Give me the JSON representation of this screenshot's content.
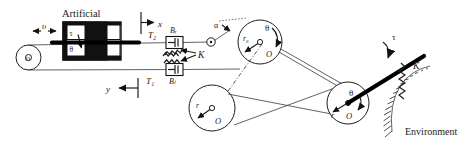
{
  "figure": {
    "title": "Artificial",
    "environment_label": "Environment",
    "background_color": "#ffffff",
    "ink_color": "#111111"
  },
  "labels": {
    "velocity": "υ",
    "artificial": "Artificial",
    "tau_actuator": "τ",
    "theta_actuator": "θ",
    "axis_x": "x",
    "axis_y": "y",
    "tension_top": "T₂",
    "tension_bottom": "T₁",
    "damper_top": "Bᵣ",
    "damper_bottom": "Bₗ",
    "spring": "K",
    "alpha": "α",
    "theta_drive": "θ",
    "radius_drive": "r₀",
    "center_drive": "O",
    "radius_idler": "r",
    "center_idler": "O",
    "theta_load": "θ",
    "radius_load": "r",
    "center_load": "O",
    "tau_load": "τ",
    "spring_env": "K",
    "environment": "Environment"
  },
  "components": [
    {
      "name": "drive-pulley-left",
      "type": "circle",
      "label": "O"
    },
    {
      "name": "actuator-block",
      "type": "block",
      "label": "Artificial"
    },
    {
      "name": "damper-top",
      "type": "damper",
      "label": "Bᵣ"
    },
    {
      "name": "damper-bottom",
      "type": "damper",
      "label": "Bₗ"
    },
    {
      "name": "spring-top",
      "type": "spring",
      "label": "K"
    },
    {
      "name": "spring-bottom",
      "type": "spring",
      "label": "K"
    },
    {
      "name": "pulley-drive",
      "type": "circle",
      "label": "O",
      "radius_label": "r₀"
    },
    {
      "name": "pulley-idler",
      "type": "circle",
      "label": "O",
      "radius_label": "r"
    },
    {
      "name": "pulley-load",
      "type": "circle",
      "label": "O",
      "radius_label": "r"
    },
    {
      "name": "load-bar",
      "type": "bar",
      "label": "τ"
    },
    {
      "name": "environment-spring",
      "type": "spring",
      "label": "K"
    },
    {
      "name": "environment-ground",
      "type": "hatch",
      "label": "Environment"
    }
  ]
}
